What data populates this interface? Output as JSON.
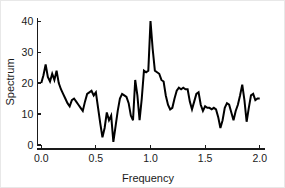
{
  "chart_data": {
    "type": "line",
    "title": "",
    "subtitle": "",
    "xlabel": "Frequency",
    "ylabel": "Spectrum",
    "xlim": [
      -0.03,
      2.03
    ],
    "ylim": [
      0,
      41
    ],
    "xticks": [
      0.0,
      0.5,
      1.0,
      1.5,
      2.0
    ],
    "xticklabels": [
      "0.0",
      "0.5",
      "1.0",
      "1.5",
      "2.0"
    ],
    "yticks": [
      0,
      10,
      20,
      30,
      40
    ],
    "yticklabels": [
      "0",
      "10",
      "20",
      "30",
      "40"
    ],
    "grid": false,
    "legend": null,
    "line_color": "#000000",
    "axis_color": "#1a1a1a",
    "background_color": "#ffffff",
    "series": [
      {
        "name": "Spectrum",
        "x": [
          0.0,
          0.02,
          0.04,
          0.06,
          0.08,
          0.1,
          0.12,
          0.14,
          0.16,
          0.18,
          0.2,
          0.22,
          0.24,
          0.26,
          0.28,
          0.3,
          0.32,
          0.34,
          0.36,
          0.38,
          0.4,
          0.42,
          0.44,
          0.46,
          0.48,
          0.5,
          0.52,
          0.54,
          0.56,
          0.58,
          0.6,
          0.62,
          0.64,
          0.66,
          0.68,
          0.7,
          0.72,
          0.74,
          0.76,
          0.78,
          0.8,
          0.82,
          0.84,
          0.86,
          0.88,
          0.9,
          0.92,
          0.94,
          0.96,
          0.98,
          1.0,
          1.02,
          1.04,
          1.06,
          1.08,
          1.1,
          1.12,
          1.14,
          1.16,
          1.18,
          1.2,
          1.22,
          1.24,
          1.26,
          1.28,
          1.3,
          1.32,
          1.34,
          1.36,
          1.38,
          1.4,
          1.42,
          1.44,
          1.46,
          1.48,
          1.5,
          1.52,
          1.54,
          1.56,
          1.58,
          1.6,
          1.62,
          1.64,
          1.66,
          1.68,
          1.7,
          1.72,
          1.74,
          1.76,
          1.78,
          1.8,
          1.82,
          1.84,
          1.86,
          1.88,
          1.9,
          1.92,
          1.94,
          1.96,
          1.98,
          2.0
        ],
        "y": [
          20.0,
          22.5,
          26.0,
          22.0,
          20.5,
          23.0,
          21.0,
          24.0,
          20.0,
          18.0,
          16.5,
          15.0,
          13.5,
          12.5,
          14.5,
          15.0,
          14.0,
          13.0,
          12.0,
          11.0,
          14.0,
          16.5,
          17.0,
          17.5,
          16.0,
          17.0,
          12.0,
          7.0,
          2.5,
          5.5,
          10.5,
          8.0,
          9.5,
          1.0,
          6.0,
          11.0,
          15.0,
          16.5,
          16.0,
          15.5,
          13.5,
          9.5,
          8.0,
          21.0,
          16.0,
          8.0,
          15.0,
          24.0,
          23.5,
          24.0,
          40.0,
          31.0,
          24.0,
          23.5,
          23.0,
          21.0,
          20.5,
          16.0,
          13.0,
          11.5,
          12.0,
          15.0,
          17.5,
          18.5,
          18.0,
          18.5,
          18.0,
          18.0,
          14.0,
          11.5,
          14.0,
          16.5,
          17.0,
          13.0,
          11.0,
          12.5,
          12.0,
          12.0,
          11.5,
          12.0,
          11.5,
          9.0,
          5.5,
          8.0,
          12.0,
          13.5,
          13.0,
          10.5,
          8.0,
          11.0,
          13.0,
          16.0,
          19.5,
          14.5,
          7.5,
          12.0,
          16.0,
          16.5,
          14.5,
          15.0,
          15.0
        ]
      }
    ]
  },
  "labels": {
    "x_axis_title": "Frequency",
    "y_axis_title": "Spectrum"
  }
}
